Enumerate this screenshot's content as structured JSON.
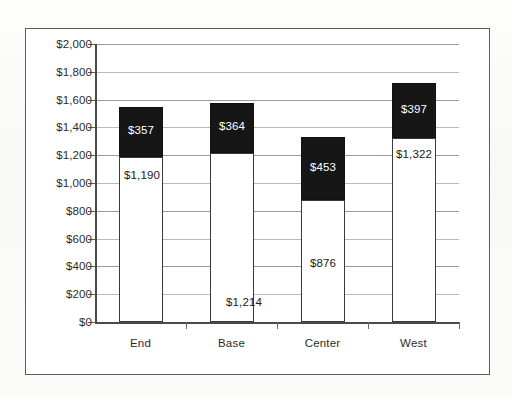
{
  "chart_data": {
    "type": "bar",
    "subtype": "stacked-column",
    "title": "",
    "xlabel": "",
    "ylabel": "",
    "categories": [
      "End",
      "Base",
      "Center",
      "West"
    ],
    "series": [
      {
        "name": "bottom-segment",
        "color": "#ffffff",
        "values": [
          1190,
          1214,
          876,
          1322
        ],
        "labels": [
          "$1,190",
          "$1,214",
          "$876",
          "$1,322"
        ]
      },
      {
        "name": "top-segment",
        "color": "#161616",
        "values": [
          357,
          364,
          453,
          397
        ],
        "labels": [
          "$357",
          "$364",
          "$453",
          "$397"
        ]
      }
    ],
    "totals": [
      1547,
      1578,
      1329,
      1719
    ],
    "ylim": [
      0,
      2000
    ],
    "ytick_step": 200,
    "ytick_labels": [
      "$2,000",
      "$1,800",
      "$1,600",
      "$1,400",
      "$1,200",
      "$1,000",
      "$800",
      "$600",
      "$400",
      "$200",
      "$0"
    ],
    "ytick_values": [
      2000,
      1800,
      1600,
      1400,
      1200,
      1000,
      800,
      600,
      400,
      200,
      0
    ],
    "grid": true,
    "legend": "none",
    "currency_prefix": "$"
  },
  "frame": {
    "border_color": "#5d5d5d",
    "background": "#ffffff"
  },
  "page": {
    "background": "#fbfbfa"
  }
}
